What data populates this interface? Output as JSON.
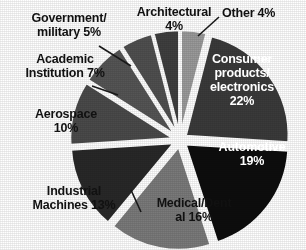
{
  "chart_data": {
    "type": "pie",
    "title": "",
    "subtitle": "",
    "xlabel": "",
    "ylabel": "",
    "legend_position": "none",
    "grid": false,
    "exploded": true,
    "value_unit": "percent",
    "categories": [
      "Consumer products/electronics",
      "Automotive",
      "Medical/Dental",
      "Industrial Machines",
      "Aerospace",
      "Academic Institution",
      "Government/military",
      "Architectural",
      "Other"
    ],
    "values": [
      22,
      19,
      16,
      13,
      10,
      7,
      5,
      4,
      4
    ],
    "slices": [
      {
        "id": "consumer",
        "label": "Consumer\nproducts/\nelectronics\n22%",
        "name": "Consumer products/electronics",
        "value": 22,
        "value_text": "22%",
        "color": "#3a3a3a",
        "label_placement": "inside",
        "label_color": "#ffffff",
        "start_angle": 14.4,
        "end_angle": 93.6
      },
      {
        "id": "automotive",
        "label": "Automotive\n19%",
        "name": "Automotive",
        "value": 19,
        "value_text": "19%",
        "color": "#0d0d0d",
        "label_placement": "inside",
        "label_color": "#ffffff",
        "start_angle": 93.6,
        "end_angle": 162.0
      },
      {
        "id": "medical",
        "label": "Medical/Dent\nal 16%",
        "name": "Medical/Dental",
        "value": 16,
        "value_text": "16%",
        "color": "#7a7a7a",
        "label_placement": "inside",
        "label_color": "#111111",
        "start_angle": 162.0,
        "end_angle": 219.6
      },
      {
        "id": "industrial",
        "label": "Industrial\nMachines 13%",
        "name": "Industrial Machines",
        "value": 13,
        "value_text": "13%",
        "color": "#282828",
        "label_placement": "outside",
        "label_color": "#111111",
        "start_angle": 219.6,
        "end_angle": 266.4
      },
      {
        "id": "aerospace",
        "label": "Aerospace\n10%",
        "name": "Aerospace",
        "value": 10,
        "value_text": "10%",
        "color": "#4a4a4a",
        "label_placement": "outside",
        "label_color": "#111111",
        "start_angle": 266.4,
        "end_angle": 302.4
      },
      {
        "id": "academic",
        "label": "Academic\nInstitution 7%",
        "name": "Academic Institution",
        "value": 7,
        "value_text": "7%",
        "color": "#555555",
        "label_placement": "outside",
        "label_color": "#111111",
        "start_angle": 302.4,
        "end_angle": 327.6
      },
      {
        "id": "government",
        "label": "Government/\nmilitary  5%",
        "name": "Government/military",
        "value": 5,
        "value_text": "5%",
        "color": "#4f4f4f",
        "label_placement": "outside",
        "label_color": "#111111",
        "start_angle": 327.6,
        "end_angle": 345.6
      },
      {
        "id": "architectural",
        "label": "Architectural\n4%",
        "name": "Architectural",
        "value": 4,
        "value_text": "4%",
        "color": "#3f3f3f",
        "label_placement": "outside",
        "label_color": "#111111",
        "start_angle": 345.6,
        "end_angle": 360.0
      },
      {
        "id": "other",
        "label": "Other 4%",
        "name": "Other",
        "value": 4,
        "value_text": "4%",
        "color": "#9a9a9a",
        "label_placement": "outside",
        "label_color": "#111111",
        "start_angle": 0.0,
        "end_angle": 14.4
      }
    ]
  },
  "labels": {
    "government": "Government/\nmilitary  5%",
    "architectural": "Architectural\n4%",
    "other": "Other 4%",
    "academic": "Academic\nInstitution 7%",
    "aerospace": "Aerospace\n10%",
    "industrial": "Industrial\nMachines 13%",
    "consumer": "Consumer\nproducts/\nelectronics\n22%",
    "automotive": "Automotive\n19%",
    "medical": "Medical/Dent\nal 16%"
  },
  "geometry": {
    "center_x": 180,
    "center_y": 140,
    "radius": 103,
    "explode_offset": 7
  },
  "colors": {
    "background": "#ffffff",
    "slice_edge": "#ffffff",
    "leader_line": "#1a1a1a",
    "text_dark": "#111111",
    "text_light": "#ffffff"
  }
}
